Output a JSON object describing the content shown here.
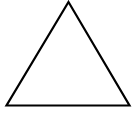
{
  "canvas": {
    "width": 135,
    "height": 114,
    "background_color": "#ffffff"
  },
  "figure": {
    "name": "triangle",
    "shape_type": "triangle",
    "fill": "none",
    "stroke_color": "#000000",
    "stroke_width": 2.2,
    "stroke_linejoin": "miter",
    "vertices": [
      {
        "label": "apex",
        "x": 68.5,
        "y": 2.0
      },
      {
        "label": "bottom-right",
        "x": 129.5,
        "y": 105.5
      },
      {
        "label": "bottom-left",
        "x": 6.5,
        "y": 105.5
      }
    ],
    "points_attr": "68.5,2 129.5,105.5 6.5,105.5"
  }
}
